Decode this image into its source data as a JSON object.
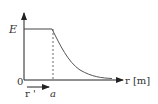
{
  "diagram": {
    "y_axis_label": "E",
    "x_axis_label": "r [m]",
    "origin_label": "0",
    "radius_label": "a",
    "vector_label": "r '",
    "colors": {
      "stroke": "#222222",
      "curve": "#555555",
      "text": "#333333"
    }
  }
}
